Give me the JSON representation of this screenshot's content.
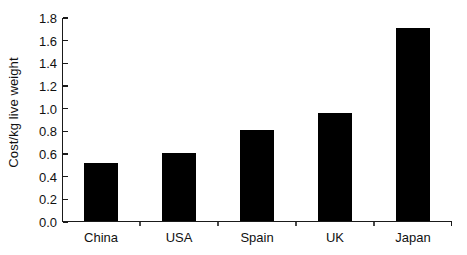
{
  "chart_data": {
    "type": "bar",
    "title": "",
    "subtitle": "",
    "xlabel": "",
    "ylabel": "Cost/kg live weight",
    "categories": [
      "China",
      "USA",
      "Spain",
      "UK",
      "Japan"
    ],
    "values": [
      0.51,
      0.6,
      0.8,
      0.95,
      1.7
    ],
    "series": [
      {
        "name": "Cost/kg live weight",
        "values": [
          0.51,
          0.6,
          0.8,
          0.95,
          1.7
        ]
      }
    ],
    "ylim": [
      0.0,
      1.8
    ],
    "ytick_values": [
      0.0,
      0.2,
      0.4,
      0.6,
      0.8,
      1.0,
      1.2,
      1.4,
      1.6,
      1.8
    ],
    "ytick_labels": [
      "0.0",
      "0.2",
      "0.4",
      "0.6",
      "0.8",
      "1.0",
      "1.2",
      "1.4",
      "1.6",
      "1.8"
    ],
    "grid": false,
    "legend": false,
    "legend_position": "none",
    "bar_color": "#000000",
    "axis_color": "#1a1a1a",
    "background_color": "#ffffff",
    "annotations": []
  }
}
